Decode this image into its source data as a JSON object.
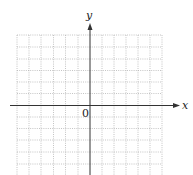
{
  "diagram": {
    "type": "coordinate-plane",
    "x_axis_label": "x",
    "y_axis_label": "y",
    "origin_label": "0",
    "grid": {
      "style": "dotted",
      "columns": 12,
      "rows_visible": 12,
      "line_color": "#b0b0b0"
    },
    "axis_color": "#333333"
  }
}
